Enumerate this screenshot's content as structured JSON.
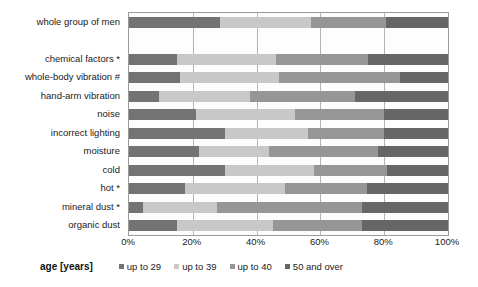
{
  "chart_data": {
    "type": "bar",
    "orientation": "horizontal",
    "stacked": true,
    "stack_mode": "percent",
    "title": "",
    "xlabel": "",
    "ylabel": "",
    "xlim": [
      0,
      100
    ],
    "grid": true,
    "grid_axis": "x",
    "legend_position": "bottom",
    "legend_title": "age [years]",
    "xticks": [
      0,
      20,
      40,
      60,
      80,
      100
    ],
    "xtick_labels": [
      "0%",
      "20%",
      "40%",
      "60%",
      "80%",
      "100%"
    ],
    "categories": [
      "whole group of men",
      "",
      "chemical factors *",
      "whole-body vibration #",
      "hand-arm vibration",
      "noise",
      "incorrect lighting",
      "moisture",
      "cold",
      "hot *",
      "mineral dust *",
      "organic dust"
    ],
    "series": [
      {
        "name": "up to 29",
        "color": "#737373",
        "values": [
          28.5,
          null,
          15.0,
          16.0,
          9.5,
          21.0,
          30.0,
          22.0,
          30.0,
          17.5,
          4.5,
          15.0
        ]
      },
      {
        "name": "up to 39",
        "color": "#c8c8c8",
        "values": [
          28.5,
          null,
          31.0,
          31.0,
          28.5,
          31.0,
          26.0,
          22.0,
          28.0,
          31.5,
          23.0,
          30.0
        ]
      },
      {
        "name": "up to 40",
        "color": "#969696",
        "values": [
          23.5,
          null,
          29.0,
          38.0,
          33.0,
          28.0,
          24.0,
          34.0,
          23.0,
          25.5,
          45.5,
          28.0
        ]
      },
      {
        "name": "50 and over",
        "color": "#666666",
        "values": [
          19.5,
          null,
          25.0,
          15.0,
          29.0,
          20.0,
          20.0,
          22.0,
          19.0,
          25.5,
          27.0,
          27.0
        ]
      }
    ]
  },
  "legend": {
    "title": "age [years]",
    "items": [
      {
        "label": "up to 29",
        "color": "#737373"
      },
      {
        "label": "up to 39",
        "color": "#c8c8c8"
      },
      {
        "label": "up to 40",
        "color": "#969696"
      },
      {
        "label": "50 and over",
        "color": "#666666"
      }
    ]
  }
}
